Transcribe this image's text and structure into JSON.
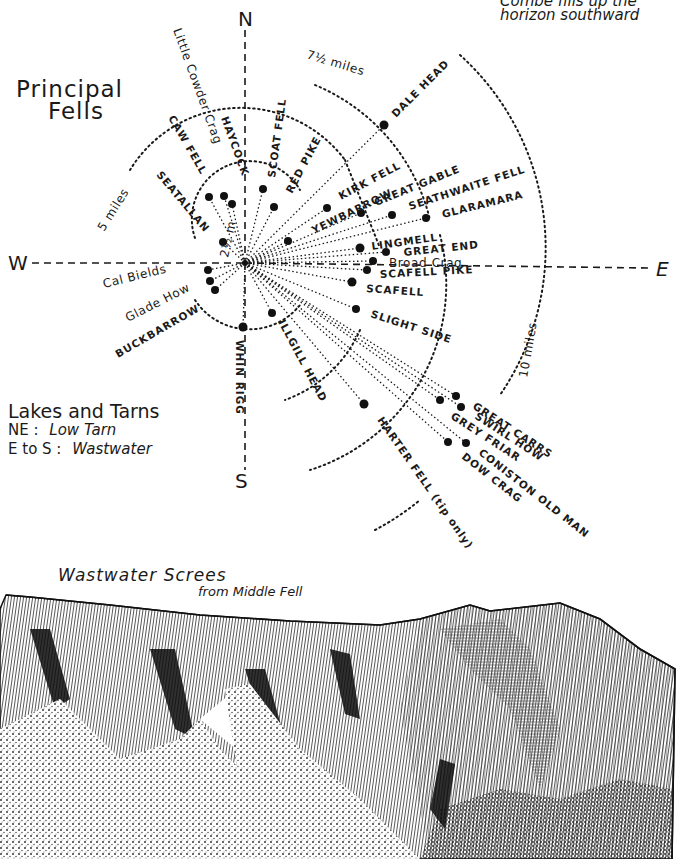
{
  "top_note": {
    "line1": "Combé fills up the",
    "line2": "horizon southward"
  },
  "diagram": {
    "title_line1": "Principal",
    "title_line2": "Fells",
    "compass": {
      "n": "N",
      "s": "S",
      "e": "E",
      "w": "W"
    },
    "distance_labels": {
      "r1": "2½ m",
      "r2": "5 miles",
      "r3": "7½ miles",
      "r4": "10 miles"
    },
    "fells": [
      {
        "name": "Little Cowder Crag",
        "x": 232,
        "y": 204
      },
      {
        "name": "HAYCOCK",
        "x": 224,
        "y": 196
      },
      {
        "name": "CAW FELL",
        "x": 209,
        "y": 197
      },
      {
        "name": "SCOAT FELL",
        "x": 263,
        "y": 189
      },
      {
        "name": "RED PIKE",
        "x": 274,
        "y": 207
      },
      {
        "name": "SEATALLAN",
        "x": 223,
        "y": 242
      },
      {
        "name": "DALE HEAD",
        "x": 384,
        "y": 125
      },
      {
        "name": "KIRK FELL",
        "x": 327,
        "y": 208
      },
      {
        "name": "YEWBARROW",
        "x": 288,
        "y": 241
      },
      {
        "name": "GREAT GABLE",
        "x": 361,
        "y": 213
      },
      {
        "name": "SEATHWAITE FELL",
        "x": 392,
        "y": 215
      },
      {
        "name": "GLARAMARA",
        "x": 426,
        "y": 218
      },
      {
        "name": "LINGMELL",
        "x": 360,
        "y": 248
      },
      {
        "name": "GREAT END",
        "x": 386,
        "y": 252
      },
      {
        "name": "Broad Crag",
        "x": 373,
        "y": 261
      },
      {
        "name": "SCAFELL PIKE",
        "x": 367,
        "y": 270
      },
      {
        "name": "SCAFELL",
        "x": 352,
        "y": 282
      },
      {
        "name": "SLIGHT SIDE",
        "x": 356,
        "y": 309
      },
      {
        "name": "Cal Bields",
        "x": 208,
        "y": 270
      },
      {
        "name": "Glade How",
        "x": 210,
        "y": 281
      },
      {
        "name": "BUCKBARROW",
        "x": 215,
        "y": 290
      },
      {
        "name": "WHIN RIGG",
        "x": 243,
        "y": 327
      },
      {
        "name": "ILLGILL HEAD",
        "x": 272,
        "y": 313
      },
      {
        "name": "HARTER FELL (tip only)",
        "x": 364,
        "y": 404
      },
      {
        "name": "GREAT CARRS",
        "x": 456,
        "y": 396
      },
      {
        "name": "SWIRL HOW",
        "x": 461,
        "y": 407
      },
      {
        "name": "GREY FRIAR",
        "x": 440,
        "y": 400
      },
      {
        "name": "CONISTON OLD MAN",
        "x": 466,
        "y": 443
      },
      {
        "name": "DOW CRAG",
        "x": 448,
        "y": 442
      }
    ]
  },
  "lakes": {
    "heading": "Lakes and Tarns",
    "ne_label": "NE :",
    "ne_value": "Low Tarn",
    "es_label": "E to S :",
    "es_value": "Wastwater"
  },
  "illustration": {
    "title": "Wastwater Screes",
    "subtitle": "from Middle Fell"
  }
}
